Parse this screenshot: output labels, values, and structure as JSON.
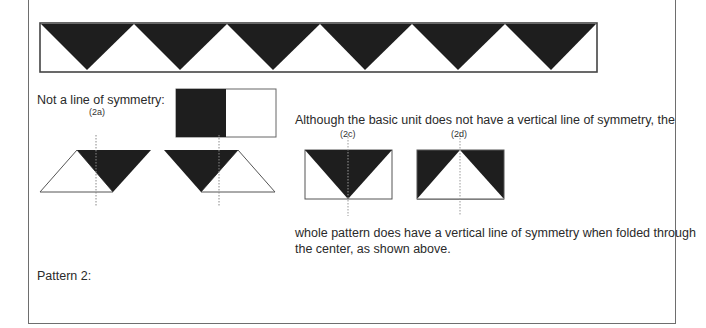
{
  "texts": {
    "not_line": "Not a line of symmetry:",
    "although": "Although the basic unit does not have a vertical line of symmetry, the",
    "whole_line1": "whole pattern does have a vertical line of symmetry when folded through",
    "whole_line2": "the center, as shown above.",
    "pattern2": "Pattern 2:"
  },
  "labels": {
    "a": "(2a)",
    "c": "(2c)",
    "d": "(2d)"
  },
  "colors": {
    "fill": "#1e1e1e",
    "stroke": "#555555",
    "frame": "#6e6e6e"
  }
}
